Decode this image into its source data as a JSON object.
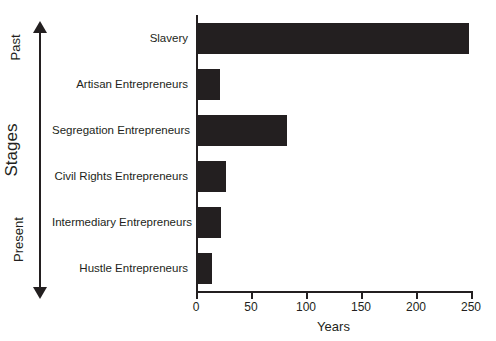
{
  "chart_data": {
    "type": "bar",
    "orientation": "horizontal",
    "title": "",
    "xlabel": "Years",
    "ylabel": "Stages",
    "xlim": [
      0,
      250
    ],
    "xticks": [
      0,
      50,
      100,
      150,
      200,
      250
    ],
    "xticklabels": [
      "0",
      "50",
      "100",
      "150",
      "200",
      "250"
    ],
    "grid": false,
    "legend": null,
    "bar_color": "#231f20",
    "categories": [
      "Slavery",
      "Artisan Entrepreneurs",
      "Segregation Entrepreneurs",
      "Civil Rights Entrepreneurs",
      "Intermediary Entrepreneurs",
      "Hustle Entrepreneurs"
    ],
    "values": [
      246,
      20,
      81,
      25,
      21,
      13
    ],
    "annotations": {
      "axis_arrow_top": "Past",
      "axis_arrow_bottom": "Present",
      "axis_arrow_name": "Stages"
    }
  },
  "axis": {
    "y_title": "Stages",
    "y_top_label": "Past",
    "y_bottom_label": "Present",
    "x_title": "Years"
  }
}
